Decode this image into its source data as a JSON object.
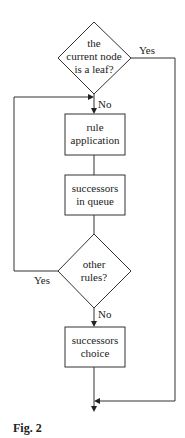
{
  "figure": {
    "caption": "Fig. 2",
    "nodes": {
      "leaf_check": {
        "type": "decision",
        "lines": [
          "the",
          "current node",
          "is a leaf?"
        ]
      },
      "rule_application": {
        "type": "process",
        "lines": [
          "rule",
          "application"
        ]
      },
      "successors_queue": {
        "type": "process",
        "lines": [
          "successors",
          "in queue"
        ]
      },
      "other_rules": {
        "type": "decision",
        "lines": [
          "other",
          "rules?"
        ]
      },
      "successors_choice": {
        "type": "process",
        "lines": [
          "successors",
          "choice"
        ]
      }
    },
    "edges": {
      "leaf_yes": "Yes",
      "leaf_no": "No",
      "rules_yes": "Yes",
      "rules_no": "No"
    }
  }
}
